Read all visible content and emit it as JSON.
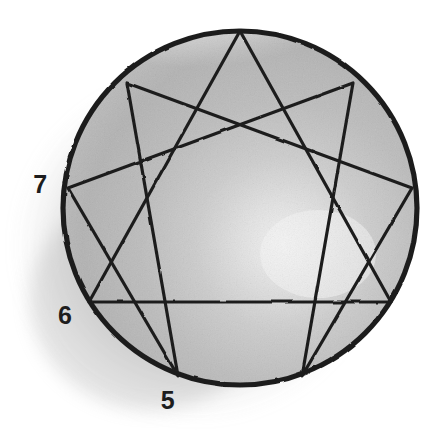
{
  "figure": {
    "name": "enneagram-diagram",
    "background_color": "#ffffff",
    "ink_color": "#1f1f1f",
    "wash_color": "#b4b4b4",
    "wash_highlight_color": "#f4f4f4",
    "shadow_color": "#b0b0b0"
  },
  "circle": {
    "name": "outer-circle",
    "center_x": 240,
    "center_y": 208,
    "radius": 177,
    "stroke_width": 5.2,
    "stroke_color": "#1f1f1f"
  },
  "points": [
    {
      "number": "9",
      "x": 240,
      "y": 31,
      "label_visible": false
    },
    {
      "number": "1",
      "x": 353,
      "y": 83,
      "label_visible": false
    },
    {
      "number": "2",
      "x": 412,
      "y": 188,
      "label_visible": false
    },
    {
      "number": "3",
      "x": 391,
      "y": 302,
      "label_visible": false
    },
    {
      "number": "4",
      "x": 302,
      "y": 376,
      "label_visible": false
    },
    {
      "number": "5",
      "x": 178,
      "y": 376,
      "label_visible": true
    },
    {
      "number": "6",
      "x": 89,
      "y": 302,
      "label_visible": true
    },
    {
      "number": "7",
      "x": 68,
      "y": 188,
      "label_visible": true
    },
    {
      "number": "8",
      "x": 127,
      "y": 83,
      "label_visible": false
    }
  ],
  "labels": {
    "seven": "7",
    "six": "6",
    "five": "5"
  },
  "triangle": {
    "name": "inner-triangle",
    "vertices": [
      "9",
      "3",
      "6"
    ],
    "stroke_width": 3.2
  },
  "hexad": {
    "name": "hexad-figure",
    "sequence": [
      "1",
      "4",
      "2",
      "8",
      "5",
      "7",
      "1"
    ],
    "stroke_width": 3.2
  },
  "chart_data": {
    "type": "diagram",
    "shape": "nine-pointed figure inscribed in a circle",
    "point_count": 9,
    "visible_point_labels": [
      "7",
      "6",
      "5"
    ],
    "point_angles_degrees": {
      "9": 270,
      "1": 310,
      "2": 350,
      "3": 30,
      "4": 70,
      "5": 110,
      "6": 150,
      "7": 190,
      "8": 230
    },
    "line_groups": [
      {
        "name": "triangle",
        "path": [
          "9",
          "3",
          "6",
          "9"
        ]
      },
      {
        "name": "hexad",
        "path": [
          "1",
          "4",
          "2",
          "8",
          "5",
          "7",
          "1"
        ]
      }
    ]
  }
}
